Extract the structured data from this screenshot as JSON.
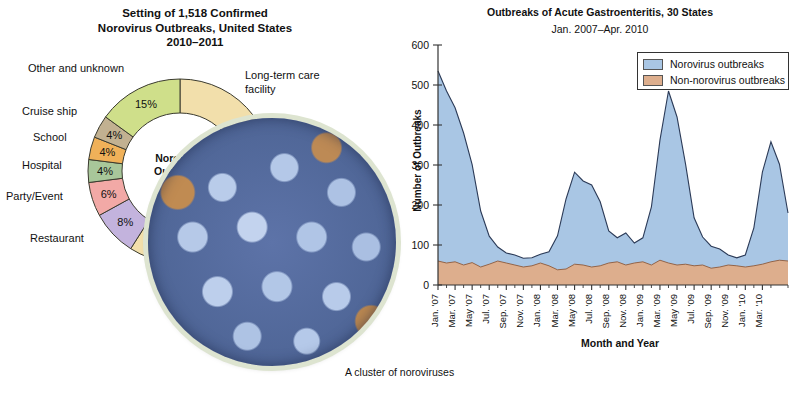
{
  "donut": {
    "title_lines": [
      "Setting of 1,518 Confirmed",
      "Norovirus Outbreaks, United States",
      "2010–2011"
    ],
    "center_line1": "Norovirus",
    "center_line2": "Outbreaks",
    "segments": [
      {
        "label": "Long-term care facility",
        "pct": 59,
        "pct_text": "59%",
        "color": "#f2dfab"
      },
      {
        "label": "Restaurant",
        "pct": 8,
        "pct_text": "8%",
        "color": "#c3b3dd"
      },
      {
        "label": "Party/Event",
        "pct": 6,
        "pct_text": "6%",
        "color": "#f2a9a6"
      },
      {
        "label": "Hospital",
        "pct": 4,
        "pct_text": "4%",
        "color": "#a8c79a"
      },
      {
        "label": "School",
        "pct": 4,
        "pct_text": "4%",
        "color": "#f0b159"
      },
      {
        "label": "Cruise ship",
        "pct": 4,
        "pct_text": "4%",
        "color": "#c2b191"
      },
      {
        "label": "Other and unknown",
        "pct": 15,
        "pct_text": "15%",
        "color": "#cfdf8a"
      }
    ]
  },
  "photo": {
    "caption": "A cluster of noroviruses"
  },
  "chart_data": {
    "type": "area",
    "title": "Outbreaks of Acute Gastroenteritis, 30 States",
    "subtitle": "Jan. 2007–Apr. 2010",
    "xlabel": "Month and Year",
    "ylabel": "Number of Outbreaks",
    "ylim": [
      0,
      600
    ],
    "yticks": [
      0,
      100,
      200,
      300,
      400,
      500,
      600
    ],
    "grid": false,
    "legend_position": "top-right",
    "stacked": true,
    "series": [
      {
        "name": "Norovirus outbreaks",
        "color": "#a9c6e4",
        "values": [
          475,
          430,
          385,
          330,
          245,
          140,
          70,
          35,
          25,
          25,
          22,
          20,
          22,
          35,
          85,
          175,
          230,
          210,
          205,
          160,
          80,
          60,
          80,
          50,
          60,
          145,
          300,
          430,
          370,
          250,
          120,
          70,
          55,
          45,
          25,
          20,
          30,
          95,
          230,
          300,
          240,
          120
        ]
      },
      {
        "name": "Non-norovirus outbreaks",
        "color": "#ddae8d",
        "values": [
          60,
          55,
          58,
          50,
          56,
          45,
          52,
          60,
          55,
          50,
          45,
          48,
          55,
          48,
          38,
          40,
          52,
          50,
          45,
          48,
          55,
          58,
          50,
          55,
          58,
          50,
          62,
          55,
          50,
          52,
          48,
          50,
          42,
          45,
          50,
          48,
          45,
          48,
          52,
          58,
          62,
          60
        ]
      }
    ],
    "xticks": [
      "Jan. '07",
      "Mar. '07",
      "May '07",
      "Jul. '07",
      "Sep. '07",
      "Nov. '07",
      "Jan. '08",
      "Mar. '08",
      "May '08",
      "Jul. '08",
      "Sep. '08",
      "Nov. '08",
      "Jan. '09",
      "Mar. '09",
      "May '09",
      "Jul. '09",
      "Sep. '09",
      "Nov. '09",
      "Jan. '10",
      "Mar. '10"
    ],
    "legend": [
      {
        "label": "Norovirus outbreaks",
        "color": "#a9c6e4"
      },
      {
        "label": "Non-norovirus outbreaks",
        "color": "#ddae8d"
      }
    ]
  }
}
